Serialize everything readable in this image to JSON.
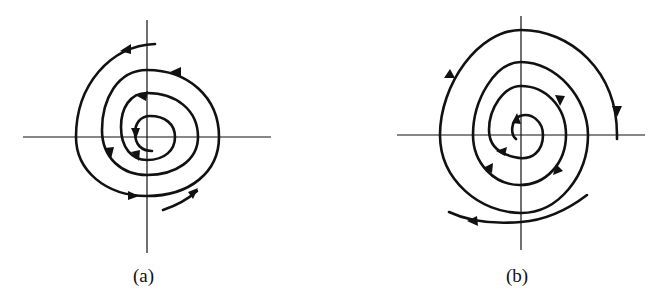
{
  "figure": {
    "panels": [
      {
        "id": "a",
        "label": "(a)",
        "description": "Spiral trajectories converging toward the origin (stable focus)",
        "direction": "inward, counterclockwise"
      },
      {
        "id": "b",
        "label": "(b)",
        "description": "Spiral trajectories diverging from the origin (unstable focus)",
        "direction": "outward, clockwise"
      }
    ]
  },
  "colors": {
    "ink": "#111111",
    "background": "#ffffff"
  }
}
